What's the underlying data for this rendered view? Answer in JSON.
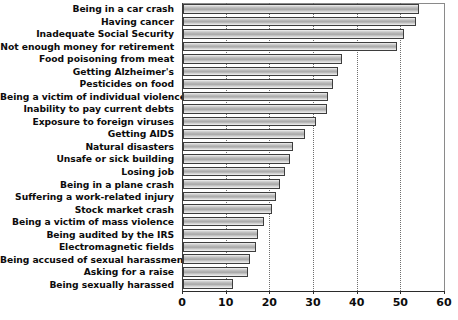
{
  "chart_data": {
    "type": "bar",
    "orientation": "horizontal",
    "title": "",
    "subtitle": "",
    "xlabel": "",
    "ylabel": "",
    "xlim": [
      0,
      60
    ],
    "xticks": [
      0,
      10,
      20,
      30,
      40,
      50,
      60
    ],
    "xtick_labels": [
      "0",
      "10",
      "20",
      "30",
      "40",
      "50",
      "60"
    ],
    "grid": true,
    "grid_axis": "x",
    "grid_style": "dotted",
    "legend": false,
    "categories": [
      "Being in a car crash",
      "Having cancer",
      "Inadequate Social Security",
      "Not enough money for retirement",
      "Food poisoning from meat",
      "Getting Alzheimer's",
      "Pesticides on food",
      "Being a victim of individual violence",
      "Inability to pay current debts",
      "Exposure to foreign viruses",
      "Getting AIDS",
      "Natural disasters",
      "Unsafe or sick building",
      "Losing job",
      "Being in a plane crash",
      "Suffering a work-related injury",
      "Stock market crash",
      "Being a victim of mass violence",
      "Being audited by the IRS",
      "Electromagnetic fields",
      "Being accused of sexual harassment",
      "Asking for a raise",
      "Being sexually harassed"
    ],
    "values": [
      54.1,
      53.4,
      50.5,
      49.1,
      36.5,
      35.6,
      34.4,
      33.3,
      32.9,
      30.4,
      27.9,
      25.2,
      24.5,
      23.4,
      22.2,
      21.2,
      20.3,
      18.5,
      17.2,
      16.7,
      15.3,
      14.8,
      11.4
    ],
    "bar_color": "#b6b6b6",
    "bar_edge_color": "#3d3d3d",
    "background_color": "#ffffff"
  }
}
